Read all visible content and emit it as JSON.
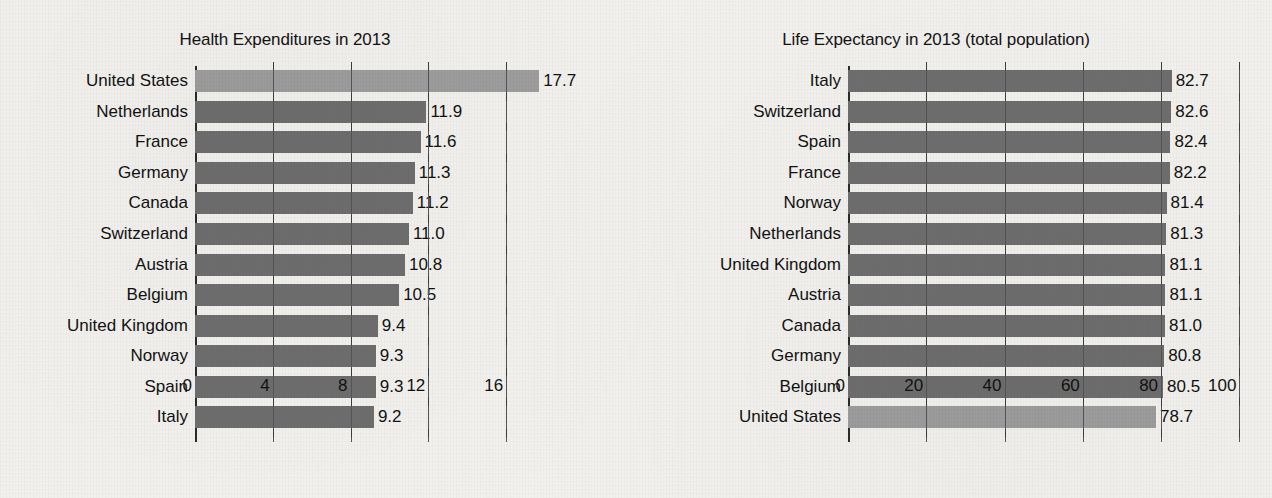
{
  "page": {
    "background_color": "#f2f1ee",
    "bar_color": "#6e6e6e",
    "highlight_bar_color": "#9d9d9d",
    "axis_color": "#2a2a2a"
  },
  "chart_data": [
    {
      "type": "bar",
      "orientation": "horizontal",
      "title": "Health Expenditures in 2013",
      "xlabel": "",
      "ylabel": "",
      "xlim": [
        0,
        18
      ],
      "xticks": [
        0,
        4,
        8,
        12,
        16
      ],
      "xtick_labels": [
        "0",
        "4",
        "8",
        "12",
        "16"
      ],
      "grid": true,
      "legend": "none",
      "highlight_category": "United States",
      "categories": [
        "United States",
        "Netherlands",
        "France",
        "Germany",
        "Canada",
        "Switzerland",
        "Austria",
        "Belgium",
        "United Kingdom",
        "Norway",
        "Spain",
        "Italy"
      ],
      "values": [
        17.7,
        11.9,
        11.6,
        11.3,
        11.2,
        11.0,
        10.8,
        10.5,
        9.4,
        9.3,
        9.3,
        9.2
      ],
      "value_labels": [
        "17.7",
        "11.9",
        "11.6",
        "11.3",
        "11.2",
        "11.0",
        "10.8",
        "10.5",
        "9.4",
        "9.3",
        "9.3",
        "9.2"
      ]
    },
    {
      "type": "bar",
      "orientation": "horizontal",
      "title": "Life Expectancy in 2013 (total population)",
      "xlabel": "",
      "ylabel": "",
      "xlim": [
        0,
        104
      ],
      "xticks": [
        0,
        20,
        40,
        60,
        80,
        100
      ],
      "xtick_labels": [
        "0",
        "20",
        "40",
        "60",
        "80",
        "100"
      ],
      "grid": true,
      "legend": "none",
      "highlight_category": "United States",
      "categories": [
        "Italy",
        "Switzerland",
        "Spain",
        "France",
        "Norway",
        "Netherlands",
        "United Kingdom",
        "Austria",
        "Canada",
        "Germany",
        "Belgium",
        "United States"
      ],
      "values": [
        82.7,
        82.6,
        82.4,
        82.2,
        81.4,
        81.3,
        81.1,
        81.1,
        81.0,
        80.8,
        80.5,
        78.7
      ],
      "value_labels": [
        "82.7",
        "82.6",
        "82.4",
        "82.2",
        "81.4",
        "81.3",
        "81.1",
        "81.1",
        "81.0",
        "80.8",
        "80.5",
        "78.7"
      ]
    }
  ]
}
